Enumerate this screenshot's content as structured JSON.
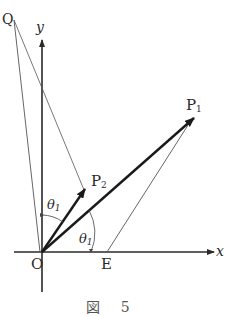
{
  "figure": {
    "caption": "図 5",
    "labels": {
      "x_axis": "x",
      "y_axis": "y",
      "origin": "O",
      "point_q": "Q",
      "point_e": "E",
      "point_p1": "P",
      "point_p1_sub": "1",
      "point_p2": "P",
      "point_p2_sub": "2",
      "angle_upper": "θ",
      "angle_upper_sub": "1",
      "angle_lower": "θ",
      "angle_lower_sub": "1"
    },
    "points": {
      "O": [
        42,
        252
      ],
      "Q": [
        14,
        20
      ],
      "P1": [
        194,
        118
      ],
      "P2": [
        84,
        190
      ],
      "E": [
        107,
        252
      ]
    },
    "colors": {
      "line": "#2a2a2a",
      "thin_line": "#555555",
      "background": "#ffffff"
    }
  }
}
